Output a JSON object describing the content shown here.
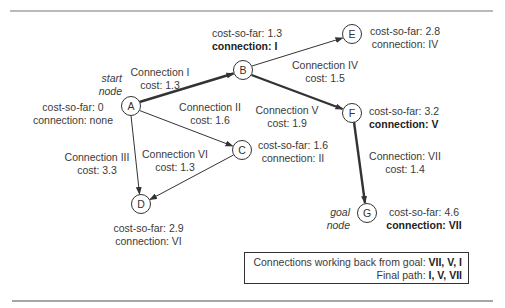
{
  "nodes": {
    "A": {
      "letter": "A",
      "tag_line1": "start",
      "tag_line2": "node",
      "cost_so_far": "cost-so-far: 0",
      "connection": "connection: none"
    },
    "B": {
      "letter": "B",
      "cost_so_far": "cost-so-far: 1.3",
      "connection": "connection: I"
    },
    "C": {
      "letter": "C",
      "cost_so_far": "cost-so-far: 1.6",
      "connection": "connection: II"
    },
    "D": {
      "letter": "D",
      "cost_so_far": "cost-so-far: 2.9",
      "connection": "connection: VI"
    },
    "E": {
      "letter": "E",
      "cost_so_far": "cost-so-far: 2.8",
      "connection": "connection: IV"
    },
    "F": {
      "letter": "F",
      "cost_so_far": "cost-so-far: 3.2",
      "connection": "connection: V"
    },
    "G": {
      "letter": "G",
      "tag_line1": "goal",
      "tag_line2": "node",
      "cost_so_far": "cost-so-far: 4.6",
      "connection": "connection: VII"
    }
  },
  "edges": {
    "I": {
      "name": "Connection I",
      "cost": "cost: 1.3",
      "from": "A",
      "to": "B",
      "on_path": true
    },
    "II": {
      "name": "Connection II",
      "cost": "cost: 1.6",
      "from": "A",
      "to": "C",
      "on_path": false
    },
    "III": {
      "name": "Connection III",
      "cost": "cost: 3.3",
      "from": "A",
      "to": "D",
      "on_path": false
    },
    "IV": {
      "name": "Connection IV",
      "cost": "cost: 1.5",
      "from": "B",
      "to": "E",
      "on_path": false
    },
    "V": {
      "name": "Connection V",
      "cost": "cost: 1.9",
      "from": "B",
      "to": "F",
      "on_path": true
    },
    "VI": {
      "name": "Connection VI",
      "cost": "cost: 1.3",
      "from": "C",
      "to": "D",
      "on_path": false
    },
    "VII": {
      "name": "Connection: VII",
      "cost": "cost: 1.4",
      "from": "F",
      "to": "G",
      "on_path": true
    }
  },
  "summary": {
    "line1_label": "Connections working back from goal: ",
    "line1_value": "VII, V, I",
    "line2_label": "Final path: ",
    "line2_value": "I, V, VII"
  },
  "colors": {
    "ink": "#333333",
    "text": "#3a3a3a",
    "rule": "#777777"
  }
}
